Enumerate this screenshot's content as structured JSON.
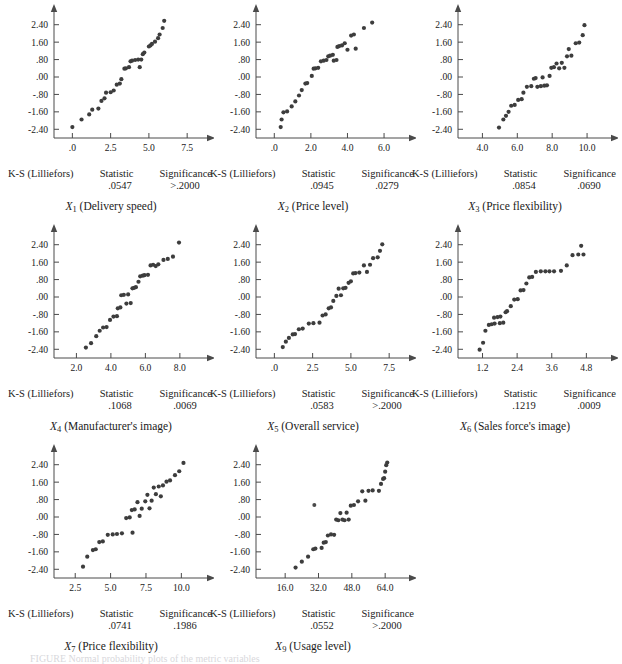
{
  "figure": {
    "caption_label": "FIGURE",
    "caption_text": "FIGURE  Normal probability plots of the metric variables",
    "background_color": "#ffffff",
    "dot_color": "#3d3d3d",
    "axis_color": "#4a4a4a"
  },
  "labels": {
    "ks_label": "K-S (Lilliefors)",
    "statistic_label": "Statistic",
    "significance_label": "Significance"
  },
  "shared": {
    "y_ticks": [
      "2.40",
      "1.60",
      ".80",
      ".00",
      "-.80",
      "-1.60",
      "-2.40"
    ],
    "y_tick_values": [
      2.4,
      1.6,
      0.8,
      0.0,
      -0.8,
      -1.6,
      -2.4
    ],
    "ylim": [
      -2.8,
      2.8
    ],
    "ylabel": "Normal score",
    "grid": false
  },
  "chart_data": [
    {
      "type": "scatter",
      "id": "x1",
      "title": "X1 (Delivery speed)",
      "var_symbol": "X",
      "var_subscript": "1",
      "var_description": "(Delivery speed)",
      "statistic": ".0547",
      "significance": ">.2000",
      "xlabel": "Delivery speed",
      "ylabel": "Normal score",
      "x_ticks": [
        ".0",
        "2.5",
        "5.0",
        "7.5"
      ],
      "x_tick_values": [
        0.0,
        2.5,
        5.0,
        7.5
      ],
      "xlim": [
        -1.2,
        8.6
      ],
      "ylim": [
        -2.8,
        2.8
      ],
      "points": [
        [
          0.0,
          -2.3
        ],
        [
          0.6,
          -1.95
        ],
        [
          1.1,
          -1.72
        ],
        [
          1.3,
          -1.5
        ],
        [
          1.7,
          -1.45
        ],
        [
          1.9,
          -1.1
        ],
        [
          2.1,
          -0.98
        ],
        [
          2.2,
          -0.72
        ],
        [
          2.5,
          -0.7
        ],
        [
          2.7,
          -0.62
        ],
        [
          2.9,
          -0.35
        ],
        [
          3.1,
          -0.3
        ],
        [
          3.2,
          -0.1
        ],
        [
          3.4,
          0.38
        ],
        [
          3.5,
          0.4
        ],
        [
          3.7,
          0.45
        ],
        [
          3.8,
          0.72
        ],
        [
          3.9,
          0.75
        ],
        [
          4.1,
          0.78
        ],
        [
          4.3,
          0.8
        ],
        [
          4.4,
          0.45
        ],
        [
          4.5,
          0.8
        ],
        [
          4.6,
          1.05
        ],
        [
          4.7,
          1.12
        ],
        [
          5.0,
          1.4
        ],
        [
          5.1,
          1.45
        ],
        [
          5.2,
          1.52
        ],
        [
          5.4,
          1.62
        ],
        [
          5.6,
          1.78
        ],
        [
          5.7,
          1.95
        ],
        [
          5.9,
          2.25
        ],
        [
          6.0,
          2.58
        ]
      ]
    },
    {
      "type": "scatter",
      "id": "x2",
      "title": "X2 (Price level)",
      "var_symbol": "X",
      "var_subscript": "2",
      "var_description": "(Price level)",
      "statistic": ".0945",
      "significance": ".0279",
      "xlabel": "Price level",
      "ylabel": "Normal score",
      "x_ticks": [
        ".0",
        "2.0",
        "4.0",
        "6.0"
      ],
      "x_tick_values": [
        0.0,
        2.0,
        4.0,
        6.0
      ],
      "xlim": [
        -1.0,
        7.2
      ],
      "ylim": [
        -2.8,
        2.8
      ],
      "points": [
        [
          0.35,
          -2.3
        ],
        [
          0.4,
          -1.95
        ],
        [
          0.5,
          -1.62
        ],
        [
          0.7,
          -1.58
        ],
        [
          0.95,
          -1.35
        ],
        [
          1.15,
          -1.12
        ],
        [
          1.35,
          -0.85
        ],
        [
          1.5,
          -0.6
        ],
        [
          1.7,
          -0.3
        ],
        [
          1.8,
          -0.28
        ],
        [
          2.05,
          0.05
        ],
        [
          2.15,
          0.38
        ],
        [
          2.25,
          0.4
        ],
        [
          2.4,
          0.42
        ],
        [
          2.55,
          0.72
        ],
        [
          2.7,
          0.75
        ],
        [
          2.85,
          0.78
        ],
        [
          2.95,
          0.95
        ],
        [
          3.05,
          0.98
        ],
        [
          3.2,
          1.02
        ],
        [
          3.25,
          0.75
        ],
        [
          3.4,
          0.78
        ],
        [
          3.45,
          1.38
        ],
        [
          3.55,
          1.42
        ],
        [
          3.7,
          1.45
        ],
        [
          3.85,
          1.55
        ],
        [
          4.0,
          1.25
        ],
        [
          4.2,
          1.9
        ],
        [
          4.35,
          1.95
        ],
        [
          4.45,
          1.3
        ],
        [
          4.9,
          2.25
        ],
        [
          5.35,
          2.5
        ]
      ]
    },
    {
      "type": "scatter",
      "id": "x3",
      "title": "X3 (Price flexibility)",
      "var_symbol": "X",
      "var_subscript": "3",
      "var_description": "(Price flexibility)",
      "statistic": ".0854",
      "significance": ".0690",
      "xlabel": "Price flexibility",
      "ylabel": "Normal score",
      "x_ticks": [
        "4.0",
        "6.0",
        "8.0",
        "10.0"
      ],
      "x_tick_values": [
        4.0,
        6.0,
        8.0,
        10.0
      ],
      "xlim": [
        2.6,
        11.2
      ],
      "ylim": [
        -2.8,
        2.8
      ],
      "points": [
        [
          4.95,
          -2.32
        ],
        [
          5.2,
          -1.95
        ],
        [
          5.35,
          -1.78
        ],
        [
          5.5,
          -1.6
        ],
        [
          5.65,
          -1.32
        ],
        [
          5.85,
          -1.28
        ],
        [
          6.05,
          -1.05
        ],
        [
          6.25,
          -1.02
        ],
        [
          6.35,
          -0.72
        ],
        [
          6.55,
          -0.45
        ],
        [
          6.8,
          -0.42
        ],
        [
          6.95,
          -0.08
        ],
        [
          7.05,
          -0.05
        ],
        [
          7.15,
          -0.45
        ],
        [
          7.35,
          -0.42
        ],
        [
          7.45,
          -0.02
        ],
        [
          7.55,
          -0.4
        ],
        [
          7.7,
          -0.38
        ],
        [
          7.85,
          0.05
        ],
        [
          7.95,
          0.42
        ],
        [
          8.1,
          0.45
        ],
        [
          8.25,
          0.62
        ],
        [
          8.4,
          0.4
        ],
        [
          8.55,
          0.65
        ],
        [
          8.7,
          0.42
        ],
        [
          8.85,
          0.95
        ],
        [
          8.95,
          1.28
        ],
        [
          9.1,
          0.98
        ],
        [
          9.35,
          1.55
        ],
        [
          9.55,
          1.58
        ],
        [
          9.75,
          1.92
        ],
        [
          9.85,
          2.38
        ]
      ]
    },
    {
      "type": "scatter",
      "id": "x4",
      "title": "X4 (Manufacturer's image)",
      "var_symbol": "X",
      "var_subscript": "4",
      "var_description": "(Manufacturer's image)",
      "statistic": ".1068",
      "significance": ".0069",
      "xlabel": "Manufacturer's image",
      "ylabel": "Normal score",
      "x_ticks": [
        "2.0",
        "4.0",
        "6.0",
        "8.0"
      ],
      "x_tick_values": [
        2.0,
        4.0,
        6.0,
        8.0
      ],
      "xlim": [
        0.7,
        9.4
      ],
      "ylim": [
        -2.8,
        2.8
      ],
      "points": [
        [
          2.55,
          -2.32
        ],
        [
          2.85,
          -2.12
        ],
        [
          3.15,
          -1.8
        ],
        [
          3.35,
          -1.55
        ],
        [
          3.55,
          -1.4
        ],
        [
          3.75,
          -1.38
        ],
        [
          3.95,
          -1.05
        ],
        [
          4.15,
          -0.9
        ],
        [
          4.35,
          -0.88
        ],
        [
          4.4,
          -0.52
        ],
        [
          4.55,
          -0.48
        ],
        [
          4.6,
          0.08
        ],
        [
          4.75,
          0.1
        ],
        [
          4.9,
          -0.3
        ],
        [
          5.0,
          0.12
        ],
        [
          5.15,
          -0.28
        ],
        [
          5.25,
          0.4
        ],
        [
          5.35,
          0.42
        ],
        [
          5.45,
          0.45
        ],
        [
          5.6,
          0.7
        ],
        [
          5.7,
          0.95
        ],
        [
          5.85,
          0.98
        ],
        [
          5.95,
          1.0
        ],
        [
          6.15,
          1.02
        ],
        [
          6.3,
          1.45
        ],
        [
          6.45,
          1.48
        ],
        [
          6.6,
          1.42
        ],
        [
          6.75,
          1.5
        ],
        [
          7.05,
          1.7
        ],
        [
          7.3,
          1.75
        ],
        [
          7.6,
          1.85
        ],
        [
          7.95,
          2.5
        ]
      ]
    },
    {
      "type": "scatter",
      "id": "x5",
      "title": "X5 (Overall service)",
      "var_symbol": "X",
      "var_subscript": "5",
      "var_description": "(Overall service)",
      "statistic": ".0583",
      "significance": ">.2000",
      "xlabel": "Overall service",
      "ylabel": "Normal score",
      "x_ticks": [
        ".0",
        "2.5",
        "5.0",
        "7.5"
      ],
      "x_tick_values": [
        0.0,
        2.5,
        5.0,
        7.5
      ],
      "xlim": [
        -1.2,
        8.6
      ],
      "ylim": [
        -2.8,
        2.8
      ],
      "points": [
        [
          0.55,
          -2.3
        ],
        [
          0.75,
          -2.05
        ],
        [
          0.95,
          -1.88
        ],
        [
          1.2,
          -1.72
        ],
        [
          1.35,
          -1.7
        ],
        [
          1.6,
          -1.48
        ],
        [
          1.85,
          -1.45
        ],
        [
          2.25,
          -1.22
        ],
        [
          2.55,
          -1.2
        ],
        [
          2.95,
          -1.18
        ],
        [
          3.15,
          -0.85
        ],
        [
          3.35,
          -0.8
        ],
        [
          3.55,
          -0.52
        ],
        [
          3.7,
          -0.48
        ],
        [
          3.85,
          -0.18
        ],
        [
          4.05,
          0.05
        ],
        [
          4.2,
          0.38
        ],
        [
          4.35,
          0.08
        ],
        [
          4.5,
          0.4
        ],
        [
          4.65,
          0.42
        ],
        [
          4.85,
          0.65
        ],
        [
          5.0,
          0.72
        ],
        [
          5.15,
          1.08
        ],
        [
          5.3,
          1.1
        ],
        [
          5.55,
          1.12
        ],
        [
          5.85,
          1.45
        ],
        [
          6.05,
          1.15
        ],
        [
          6.25,
          1.48
        ],
        [
          6.45,
          1.78
        ],
        [
          6.75,
          1.82
        ],
        [
          6.9,
          2.12
        ],
        [
          7.05,
          2.42
        ]
      ]
    },
    {
      "type": "scatter",
      "id": "x6",
      "title": "X6 (Sales force's image)",
      "var_symbol": "X",
      "var_subscript": "6",
      "var_description": "(Sales force's image)",
      "statistic": ".1219",
      "significance": ".0009",
      "xlabel": "Sales force's image",
      "ylabel": "Normal score",
      "x_ticks": [
        "1.2",
        "2.4",
        "3.6",
        "4.8"
      ],
      "x_tick_values": [
        1.2,
        2.4,
        3.6,
        4.8
      ],
      "xlim": [
        0.35,
        5.55
      ],
      "ylim": [
        -2.8,
        2.8
      ],
      "points": [
        [
          1.1,
          -2.42
        ],
        [
          1.22,
          -2.1
        ],
        [
          1.3,
          -1.55
        ],
        [
          1.42,
          -1.28
        ],
        [
          1.52,
          -1.25
        ],
        [
          1.6,
          -0.95
        ],
        [
          1.62,
          -1.22
        ],
        [
          1.72,
          -0.92
        ],
        [
          1.8,
          -1.2
        ],
        [
          1.82,
          -0.9
        ],
        [
          1.92,
          -1.18
        ],
        [
          2.0,
          -0.7
        ],
        [
          2.05,
          -0.65
        ],
        [
          2.18,
          -0.42
        ],
        [
          2.3,
          -0.12
        ],
        [
          2.42,
          -0.1
        ],
        [
          2.52,
          0.3
        ],
        [
          2.62,
          0.32
        ],
        [
          2.72,
          0.62
        ],
        [
          2.82,
          0.9
        ],
        [
          2.92,
          0.92
        ],
        [
          3.05,
          1.15
        ],
        [
          3.22,
          1.18
        ],
        [
          3.38,
          1.18
        ],
        [
          3.52,
          1.18
        ],
        [
          3.68,
          1.18
        ],
        [
          3.92,
          1.2
        ],
        [
          4.12,
          1.45
        ],
        [
          4.32,
          1.92
        ],
        [
          4.52,
          1.95
        ],
        [
          4.62,
          2.35
        ],
        [
          4.7,
          1.95
        ]
      ]
    },
    {
      "type": "scatter",
      "id": "x7",
      "title": "X7 (Price flexibility)",
      "var_symbol": "X",
      "var_subscript": "7",
      "var_description": "(Price flexibility)",
      "statistic": ".0741",
      "significance": ".1986",
      "xlabel": "Price flexibility",
      "ylabel": "Normal score",
      "x_ticks": [
        "2.5",
        "5.0",
        "7.5",
        "10.0"
      ],
      "x_tick_values": [
        2.5,
        5.0,
        7.5,
        10.0
      ],
      "xlim": [
        1.0,
        11.6
      ],
      "ylim": [
        -2.8,
        2.8
      ],
      "points": [
        [
          3.05,
          -2.28
        ],
        [
          3.35,
          -1.82
        ],
        [
          3.75,
          -1.52
        ],
        [
          3.95,
          -1.48
        ],
        [
          4.2,
          -1.15
        ],
        [
          4.45,
          -1.12
        ],
        [
          4.8,
          -0.82
        ],
        [
          5.15,
          -0.8
        ],
        [
          5.45,
          -0.78
        ],
        [
          5.8,
          -0.75
        ],
        [
          6.1,
          -0.05
        ],
        [
          6.35,
          -0.02
        ],
        [
          6.5,
          0.32
        ],
        [
          6.55,
          -0.72
        ],
        [
          6.7,
          0.35
        ],
        [
          6.9,
          0.68
        ],
        [
          7.05,
          0.05
        ],
        [
          7.2,
          0.38
        ],
        [
          7.45,
          0.72
        ],
        [
          7.6,
          1.02
        ],
        [
          7.75,
          0.4
        ],
        [
          7.9,
          0.75
        ],
        [
          8.05,
          1.35
        ],
        [
          8.2,
          1.05
        ],
        [
          8.4,
          1.4
        ],
        [
          8.55,
          0.95
        ],
        [
          8.7,
          1.45
        ],
        [
          8.95,
          1.62
        ],
        [
          9.2,
          1.68
        ],
        [
          9.55,
          1.92
        ],
        [
          9.85,
          2.1
        ],
        [
          10.15,
          2.48
        ]
      ]
    },
    {
      "type": "scatter",
      "id": "x9",
      "title": "X9 (Usage level)",
      "var_symbol": "X",
      "var_subscript": "9",
      "var_description": "(Usage level)",
      "statistic": ".0552",
      "significance": ">.2000",
      "xlabel": "Usage level",
      "ylabel": "Normal score",
      "x_ticks": [
        "16.0",
        "32.0",
        "48.0",
        "64.0"
      ],
      "x_tick_values": [
        16.0,
        32.0,
        48.0,
        64.0
      ],
      "xlim": [
        2.0,
        74.0
      ],
      "ylim": [
        -2.8,
        2.8
      ],
      "points": [
        [
          21.0,
          -2.32
        ],
        [
          24.0,
          -2.05
        ],
        [
          27.0,
          -1.82
        ],
        [
          29.5,
          -1.48
        ],
        [
          30.5,
          -1.45
        ],
        [
          33.5,
          -1.42
        ],
        [
          34.5,
          -1.18
        ],
        [
          35.5,
          -1.15
        ],
        [
          36.5,
          -0.85
        ],
        [
          38.0,
          -0.8
        ],
        [
          39.5,
          -0.82
        ],
        [
          40.5,
          -0.12
        ],
        [
          41.5,
          -0.15
        ],
        [
          42.5,
          0.18
        ],
        [
          43.5,
          -0.12
        ],
        [
          44.5,
          -0.15
        ],
        [
          45.5,
          0.2
        ],
        [
          46.5,
          -0.12
        ],
        [
          47.5,
          0.52
        ],
        [
          49.0,
          0.55
        ],
        [
          51.0,
          0.72
        ],
        [
          53.0,
          1.18
        ],
        [
          54.5,
          0.75
        ],
        [
          56.0,
          1.2
        ],
        [
          58.0,
          1.22
        ],
        [
          61.0,
          1.2
        ],
        [
          62.0,
          1.52
        ],
        [
          63.0,
          1.75
        ],
        [
          63.5,
          1.78
        ],
        [
          64.0,
          2.08
        ],
        [
          64.5,
          2.38
        ],
        [
          65.0,
          2.5
        ]
      ],
      "stray_point": [
        30.0,
        0.55
      ]
    }
  ]
}
